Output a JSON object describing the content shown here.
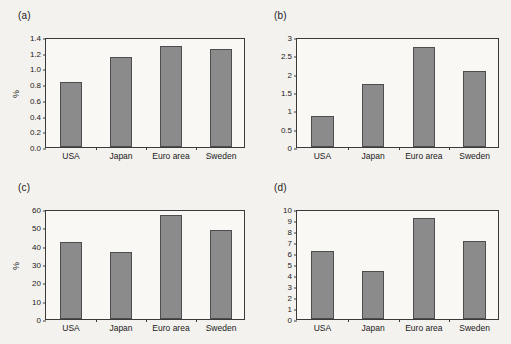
{
  "figure": {
    "background_color": "#f4f2ee",
    "bar_color": "#8b8b8b",
    "bar_edge_color": "#4d4d4d",
    "axis_color": "#3a3a3a"
  },
  "panels": {
    "a": {
      "label": "(a)",
      "ylabel": "%"
    },
    "b": {
      "label": "(b)",
      "ylabel": ""
    },
    "c": {
      "label": "(c)",
      "ylabel": "%"
    },
    "d": {
      "label": "(d)",
      "ylabel": ""
    }
  },
  "chart_data": [
    {
      "type": "bar",
      "panel": "(a)",
      "title": "",
      "xlabel": "",
      "ylabel": "%",
      "categories": [
        "USA",
        "Japan",
        "Euro area",
        "Sweden"
      ],
      "values": [
        0.83,
        1.15,
        1.28,
        1.25
      ],
      "ylim": [
        0.0,
        1.4
      ],
      "yticks": [
        0.0,
        0.2,
        0.4,
        0.6,
        0.8,
        1.0,
        1.2,
        1.4
      ],
      "ytick_labels": [
        "0.0",
        "0.2",
        "0.4",
        "0.6",
        "0.8",
        "1.0",
        "1.2",
        "1.4"
      ],
      "grid": false,
      "legend": null
    },
    {
      "type": "bar",
      "panel": "(b)",
      "title": "",
      "xlabel": "",
      "ylabel": "",
      "categories": [
        "USA",
        "Japan",
        "Euro area",
        "Sweden"
      ],
      "values": [
        0.85,
        1.73,
        2.72,
        2.08
      ],
      "ylim": [
        0,
        3
      ],
      "yticks": [
        0,
        0.5,
        1,
        1.5,
        2,
        2.5,
        3
      ],
      "ytick_labels": [
        "0",
        "0.5",
        "1",
        "1.5",
        "2",
        "2.5",
        "3"
      ],
      "grid": false,
      "legend": null
    },
    {
      "type": "bar",
      "panel": "(c)",
      "title": "",
      "xlabel": "",
      "ylabel": "%",
      "categories": [
        "USA",
        "Japan",
        "Euro area",
        "Sweden"
      ],
      "values": [
        41.8,
        36.3,
        57.0,
        48.5
      ],
      "ylim": [
        0,
        60
      ],
      "yticks": [
        0,
        10,
        20,
        30,
        40,
        50,
        60
      ],
      "ytick_labels": [
        "0",
        "10",
        "20",
        "30",
        "40",
        "50",
        "60"
      ],
      "grid": false,
      "legend": null
    },
    {
      "type": "bar",
      "panel": "(d)",
      "title": "",
      "xlabel": "",
      "ylabel": "",
      "categories": [
        "USA",
        "Japan",
        "Euro area",
        "Sweden"
      ],
      "values": [
        6.15,
        4.35,
        9.2,
        7.1
      ],
      "ylim": [
        0,
        10
      ],
      "yticks": [
        0,
        1,
        2,
        3,
        4,
        5,
        6,
        7,
        8,
        9,
        10
      ],
      "ytick_labels": [
        "0",
        "1",
        "2",
        "3",
        "4",
        "5",
        "6",
        "7",
        "8",
        "9",
        "10"
      ],
      "grid": false,
      "legend": null
    }
  ]
}
